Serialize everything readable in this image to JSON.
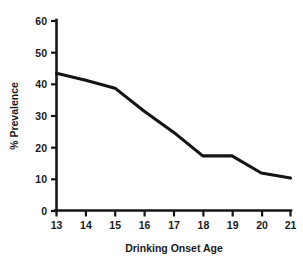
{
  "chart_data": {
    "type": "line",
    "title": "",
    "subtitle": "",
    "xlabel": "Drinking Onset Age",
    "ylabel": "% Prevalence",
    "x": [
      13,
      14,
      15,
      16,
      17,
      18,
      19,
      20,
      21
    ],
    "categories": [
      "13",
      "14",
      "15",
      "16",
      "17",
      "18",
      "19",
      "20",
      "21"
    ],
    "values": [
      43.5,
      41.3,
      38.8,
      31.5,
      24.9,
      17.4,
      17.4,
      12.0,
      10.4
    ],
    "series": [
      {
        "name": "% Prevalence",
        "values": [
          43.5,
          41.3,
          38.8,
          31.5,
          24.9,
          17.4,
          17.4,
          12.0,
          10.4
        ]
      }
    ],
    "xlim": [
      13,
      21
    ],
    "ylim": [
      0,
      60
    ],
    "ytick_labels": [
      "0",
      "10",
      "20",
      "30",
      "40",
      "50",
      "60"
    ],
    "yticks": [
      0,
      10,
      20,
      30,
      40,
      50,
      60
    ],
    "xtick_labels": [
      "13",
      "14",
      "15",
      "16",
      "17",
      "18",
      "19",
      "20",
      "21"
    ],
    "grid": false,
    "legend": false,
    "legend_position": "none",
    "line_color": "#141414",
    "axis_color": "#161616",
    "background_color": "#ffffff"
  },
  "axes": {
    "y_title": "% Prevalence",
    "x_title": "Drinking Onset Age",
    "y_ticks": [
      {
        "label": "60"
      },
      {
        "label": "50"
      },
      {
        "label": "40"
      },
      {
        "label": "30"
      },
      {
        "label": "20"
      },
      {
        "label": "10"
      },
      {
        "label": "0"
      }
    ],
    "x_ticks": [
      {
        "label": "13"
      },
      {
        "label": "14"
      },
      {
        "label": "15"
      },
      {
        "label": "16"
      },
      {
        "label": "17"
      },
      {
        "label": "18"
      },
      {
        "label": "19"
      },
      {
        "label": "20"
      },
      {
        "label": "21"
      }
    ]
  }
}
